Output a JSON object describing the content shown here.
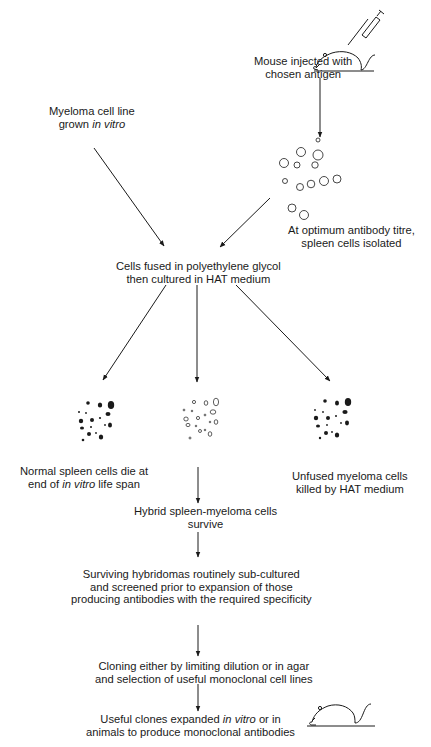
{
  "diagram": {
    "title": "",
    "nodes": {
      "mouse_injected": {
        "line1": "Mouse injected with",
        "line2": "chosen antigen"
      },
      "myeloma": {
        "line1": "Myeloma cell line",
        "line2_pre": "grown ",
        "line2_italic": "in vitro"
      },
      "spleen_isolated": {
        "line1": "At optimum antibody titre,",
        "line2": "spleen cells isolated"
      },
      "fusion": {
        "line1": "Cells fused in polyethylene glycol",
        "line2": "then cultured in HAT medium"
      },
      "normal_spleen": {
        "line1": "Normal spleen cells die at",
        "line2_pre": "end of ",
        "line2_italic": "in vitro",
        "line2_post": " life span"
      },
      "unfused_myeloma": {
        "line1": "Unfused myeloma cells",
        "line2": "killed by HAT medium"
      },
      "hybrid": {
        "line1": "Hybrid spleen-myeloma cells",
        "line2": "survive"
      },
      "screening": {
        "line1": "Surviving hybridomas routinely sub-cultured",
        "line2": "and screened prior to expansion of those",
        "line3": "producing antibodies with the required specificity"
      },
      "cloning": {
        "line1": "Cloning either by limiting dilution or in agar",
        "line2": "and selection of useful monoclonal cell lines"
      },
      "expansion": {
        "line1_pre": "Useful clones expanded ",
        "line1_italic": "in vitro",
        "line1_post": " or in",
        "line2": "animals to produce monoclonal antibodies"
      }
    },
    "icons": [
      "mouse-with-syringe-icon",
      "spleen-cells-cluster-icon",
      "dead-spleen-cells-icon",
      "hybrid-cells-icon",
      "dead-myeloma-cells-icon",
      "mouse-icon"
    ],
    "colors": {
      "ink": "#1a1a1a",
      "background": "#ffffff"
    }
  }
}
